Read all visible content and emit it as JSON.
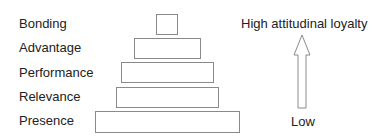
{
  "pyramid": {
    "levels": [
      {
        "label": "Bonding"
      },
      {
        "label": "Advantage"
      },
      {
        "label": "Performance"
      },
      {
        "label": "Relevance"
      },
      {
        "label": "Presence"
      }
    ]
  },
  "axis": {
    "high_label": "High attitudinal loyalty",
    "low_label": "Low",
    "arrow_icon": "up-arrow-icon"
  }
}
